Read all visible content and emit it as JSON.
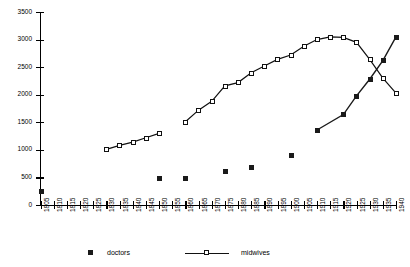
{
  "chart_data": {
    "type": "line",
    "title": "",
    "subtitle": "",
    "xlabel": "",
    "ylabel": "",
    "xlim": [
      1805,
      1940
    ],
    "ylim": [
      0,
      3500
    ],
    "grid": false,
    "legend_position": "bottom",
    "x_ticks": [
      "1805",
      "1810",
      "1815",
      "1820",
      "1825",
      "1830",
      "1835",
      "1840",
      "1845",
      "1850",
      "1855",
      "1860",
      "1865",
      "1870",
      "1875",
      "1880",
      "1885",
      "1890",
      "1895",
      "1900",
      "1905",
      "1910",
      "1915",
      "1920",
      "1925",
      "1930",
      "1935",
      "1940"
    ],
    "y_ticks": [
      "0",
      "500",
      "1000",
      "1500",
      "2000",
      "2500",
      "3000",
      "3500"
    ],
    "series": [
      {
        "name": "doctors",
        "marker": "filled-square",
        "line": "segmented",
        "points": [
          {
            "x": 1805,
            "y": 260,
            "connected": false
          },
          {
            "x": 1850,
            "y": 480,
            "connected": false
          },
          {
            "x": 1860,
            "y": 490,
            "connected": false
          },
          {
            "x": 1875,
            "y": 620,
            "connected": false
          },
          {
            "x": 1885,
            "y": 680,
            "connected": false
          },
          {
            "x": 1900,
            "y": 900,
            "connected": false
          },
          {
            "x": 1910,
            "y": 1360,
            "connected": false
          },
          {
            "x": 1920,
            "y": 1640,
            "connected": true
          },
          {
            "x": 1925,
            "y": 1980,
            "connected": true
          },
          {
            "x": 1930,
            "y": 2280,
            "connected": true
          },
          {
            "x": 1935,
            "y": 2620,
            "connected": true
          },
          {
            "x": 1940,
            "y": 3050,
            "connected": true
          }
        ]
      },
      {
        "name": "midwives",
        "marker": "open-square",
        "line": "solid",
        "segments": [
          [
            {
              "x": 1830,
              "y": 1010
            },
            {
              "x": 1835,
              "y": 1080
            },
            {
              "x": 1840,
              "y": 1140
            },
            {
              "x": 1845,
              "y": 1220
            },
            {
              "x": 1850,
              "y": 1300
            }
          ],
          [
            {
              "x": 1860,
              "y": 1510
            },
            {
              "x": 1865,
              "y": 1720
            },
            {
              "x": 1870,
              "y": 1880
            },
            {
              "x": 1875,
              "y": 2160
            },
            {
              "x": 1880,
              "y": 2220
            },
            {
              "x": 1885,
              "y": 2400
            },
            {
              "x": 1890,
              "y": 2520
            },
            {
              "x": 1895,
              "y": 2640
            },
            {
              "x": 1900,
              "y": 2720
            },
            {
              "x": 1905,
              "y": 2880
            },
            {
              "x": 1910,
              "y": 3000
            },
            {
              "x": 1915,
              "y": 3050
            },
            {
              "x": 1920,
              "y": 3040
            },
            {
              "x": 1925,
              "y": 2950
            },
            {
              "x": 1930,
              "y": 2640
            },
            {
              "x": 1935,
              "y": 2300
            },
            {
              "x": 1940,
              "y": 2030
            }
          ]
        ]
      }
    ]
  },
  "legend": {
    "entries": [
      {
        "label": "doctors",
        "style": "marker-only"
      },
      {
        "label": "midwives",
        "style": "line-marker"
      }
    ]
  },
  "colors": {
    "axis": "#000000",
    "doctors": "#1a1a1a",
    "midwives": "#111111",
    "background": "#ffffff"
  }
}
